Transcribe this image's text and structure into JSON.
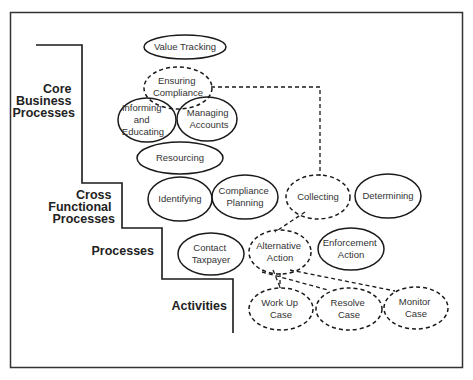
{
  "levels": [
    {
      "id": "core",
      "lines": [
        "Core",
        "Business",
        "Processes"
      ]
    },
    {
      "id": "cross",
      "lines": [
        "Cross",
        "Functional",
        "Processes"
      ]
    },
    {
      "id": "processes",
      "lines": [
        "Processes"
      ]
    },
    {
      "id": "activities",
      "lines": [
        "Activities"
      ]
    }
  ],
  "nodes": {
    "value_tracking": {
      "lines": [
        "Value Tracking"
      ],
      "style": "solid"
    },
    "ensuring_compliance": {
      "lines": [
        "Ensuring",
        "Compliance"
      ],
      "style": "dashed"
    },
    "informing_educating": {
      "lines": [
        "Informing",
        "and",
        "Educating"
      ],
      "style": "solid"
    },
    "managing_accounts": {
      "lines": [
        "Managing",
        "Accounts"
      ],
      "style": "solid"
    },
    "resourcing": {
      "lines": [
        "Resourcing"
      ],
      "style": "solid"
    },
    "identifying": {
      "lines": [
        "Identifying"
      ],
      "style": "solid"
    },
    "compliance_planning": {
      "lines": [
        "Compliance",
        "Planning"
      ],
      "style": "solid"
    },
    "collecting": {
      "lines": [
        "Collecting"
      ],
      "style": "dashed"
    },
    "determining": {
      "lines": [
        "Determining"
      ],
      "style": "solid"
    },
    "contact_taxpayer": {
      "lines": [
        "Contact",
        "Taxpayer"
      ],
      "style": "solid"
    },
    "alternative_action": {
      "lines": [
        "Alternative",
        "Action"
      ],
      "style": "dashed"
    },
    "enforcement_action": {
      "lines": [
        "Enforcement",
        "Action"
      ],
      "style": "solid"
    },
    "work_up_case": {
      "lines": [
        "Work Up",
        "Case"
      ],
      "style": "dashed"
    },
    "resolve_case": {
      "lines": [
        "Resolve",
        "Case"
      ],
      "style": "dashed"
    },
    "monitor_case": {
      "lines": [
        "Monitor",
        "Case"
      ],
      "style": "dashed"
    }
  },
  "connectors": [
    {
      "from": "ensuring_compliance",
      "to": "collecting",
      "style": "dashed"
    },
    {
      "from": "collecting",
      "to": "alternative_action",
      "style": "dashed"
    },
    {
      "from": "alternative_action",
      "to": "work_up_case",
      "style": "dashed"
    },
    {
      "from": "alternative_action",
      "to": "resolve_case",
      "style": "dashed"
    },
    {
      "from": "alternative_action",
      "to": "monitor_case",
      "style": "dashed"
    }
  ],
  "colors": {
    "stroke": "#1a1a1a",
    "text": "#333333",
    "background": "#ffffff"
  }
}
